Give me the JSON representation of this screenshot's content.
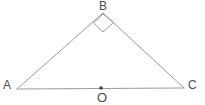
{
  "figure": {
    "type": "geometry-diagram",
    "canvas": {
      "width": 205,
      "height": 105,
      "background": "#ffffff"
    },
    "style": {
      "line_color": "#9a9a9a",
      "line_width": 1,
      "label_color": "#4a4a4a",
      "point_color": "#3a3a3a"
    },
    "vertices": [
      {
        "name": "A",
        "label": "A",
        "x": 17,
        "y": 89,
        "label_x": 3,
        "label_y": 79
      },
      {
        "name": "B",
        "label": "B",
        "x": 103,
        "y": 13,
        "label_x": 99,
        "label_y": 0
      },
      {
        "name": "C",
        "label": "C",
        "x": 184,
        "y": 88,
        "label_x": 188,
        "label_y": 79
      }
    ],
    "points": [
      {
        "name": "O",
        "label": "O",
        "x": 101,
        "y": 88,
        "label_x": 97,
        "label_y": 91,
        "marker": "filled-dot",
        "marker_size": 2
      }
    ],
    "segments": [
      {
        "name": "segment-AB",
        "from": "A",
        "to": "B",
        "x1": 17,
        "y1": 89,
        "x2": 103,
        "y2": 13
      },
      {
        "name": "segment-BC",
        "from": "B",
        "to": "C",
        "x1": 103,
        "y1": 13,
        "x2": 184,
        "y2": 88
      },
      {
        "name": "segment-AC",
        "from": "A",
        "to": "C",
        "x1": 17,
        "y1": 89,
        "x2": 184,
        "y2": 88
      }
    ],
    "angle_marks": [
      {
        "name": "right-angle-mark-B",
        "at_vertex": "B",
        "kind": "right-angle-square",
        "points": "103,14 93.5,23 103,32 113.5,22.5"
      }
    ]
  }
}
